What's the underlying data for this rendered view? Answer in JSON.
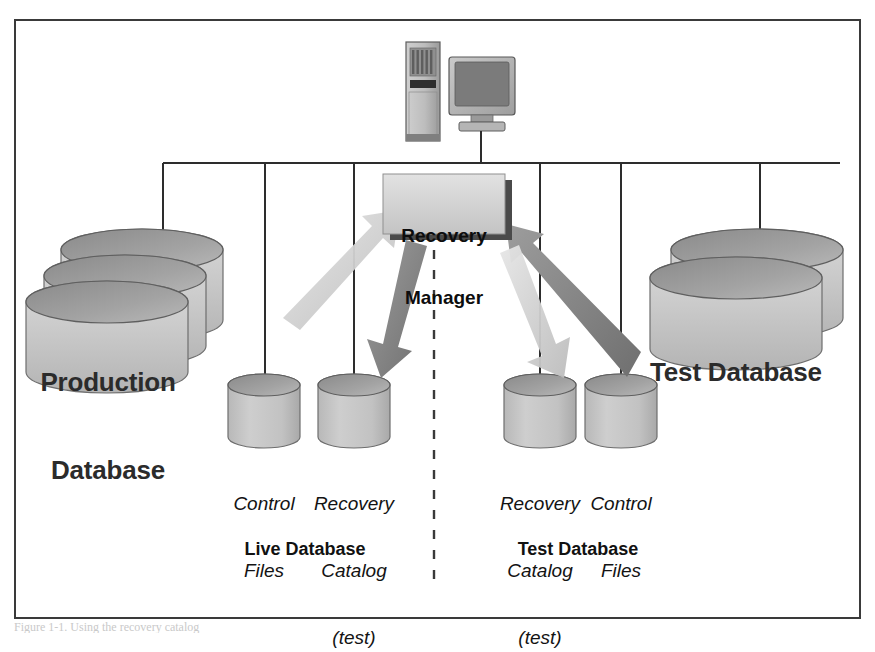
{
  "figure": {
    "caption_fragment": "Figure 1-1. Using the recovery catalog",
    "border_color": "#3a3a3a",
    "background": "#ffffff"
  },
  "palette": {
    "cylinder_face_light": "#d2d2d2",
    "cylinder_face_mid": "#bdbdbd",
    "cylinder_top_dark": "#8d8d8d",
    "cylinder_edge": "#6e6e6e",
    "box_face": "#d6d6d6",
    "box_shadow": "#4a4a4a",
    "arrow_dark": "#7d7d7d",
    "arrow_light": "#cfcfcf",
    "line": "#2d2d2d",
    "text": "#1a1a1a"
  },
  "nodes": {
    "workstation": {
      "name": "Client workstation",
      "tower_label": "tower",
      "monitor_label": "monitor"
    },
    "recovery_manager": {
      "line1": "Recovery",
      "line2": "Manager"
    },
    "production_database": {
      "line1": "Production",
      "line2": "Database",
      "stack_count": 3
    },
    "test_database_large": {
      "line1": "Test Database",
      "stack_count": 2
    }
  },
  "small_stores": [
    {
      "id": "control-files-live",
      "line1": "Control",
      "line2": "Files",
      "line3": ""
    },
    {
      "id": "recovery-catalog-live",
      "line1": "Recovery",
      "line2": "Catalog",
      "line3": "(test)"
    },
    {
      "id": "recovery-catalog-test",
      "line1": "Recovery",
      "line2": "Catalog",
      "line3": "(test)"
    },
    {
      "id": "control-files-test",
      "line1": "Control",
      "line2": "Files",
      "line3": ""
    }
  ],
  "sections": [
    {
      "id": "live-database",
      "label": "Live Database"
    },
    {
      "id": "test-database",
      "label": "Test Database"
    }
  ],
  "divider": {
    "style": "dashed",
    "orientation": "vertical"
  },
  "flows": [
    {
      "id": "flow-live-in",
      "direction": "up-right",
      "tone": "light",
      "from": "live side",
      "to": "Recovery Manager"
    },
    {
      "id": "flow-live-out",
      "direction": "down-right",
      "tone": "dark",
      "from": "Recovery Manager",
      "to": "Recovery Catalog (test)"
    },
    {
      "id": "flow-test-in",
      "direction": "up-left",
      "tone": "dark",
      "from": "test side",
      "to": "Recovery Manager"
    },
    {
      "id": "flow-test-out",
      "direction": "down-left",
      "tone": "light",
      "from": "Recovery Manager",
      "to": "Recovery Catalog (test)"
    }
  ]
}
